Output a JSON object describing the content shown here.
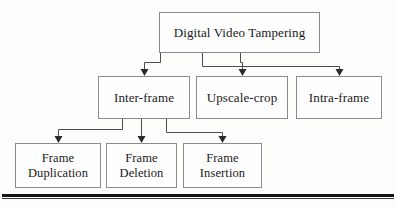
{
  "diagram": {
    "type": "hierarchy-tree",
    "title_node": "Digital Video Tampering",
    "nodes": {
      "root": {
        "label": "Digital Video Tampering"
      },
      "inter_frame": {
        "label": "Inter-frame"
      },
      "upscale_crop": {
        "label": "Upscale-crop"
      },
      "intra_frame": {
        "label": "Intra-frame"
      },
      "frame_duplication": {
        "label": "Frame\nDuplication"
      },
      "frame_deletion": {
        "label": "Frame\nDeletion"
      },
      "frame_insertion": {
        "label": "Frame\nInsertion"
      }
    },
    "edges": [
      {
        "from": "root",
        "to": "inter_frame"
      },
      {
        "from": "root",
        "to": "upscale_crop"
      },
      {
        "from": "root",
        "to": "intra_frame"
      },
      {
        "from": "inter_frame",
        "to": "frame_duplication"
      },
      {
        "from": "inter_frame",
        "to": "frame_deletion"
      },
      {
        "from": "inter_frame",
        "to": "frame_insertion"
      }
    ],
    "colors": {
      "box_border": "#8b8b8b",
      "box_fill": "#fefefe",
      "connector": "#4d4d4d",
      "arrowhead": "#2b2b2b",
      "text": "#1a1a1a",
      "rule": "#141414",
      "background": "#fdfdfc"
    }
  }
}
